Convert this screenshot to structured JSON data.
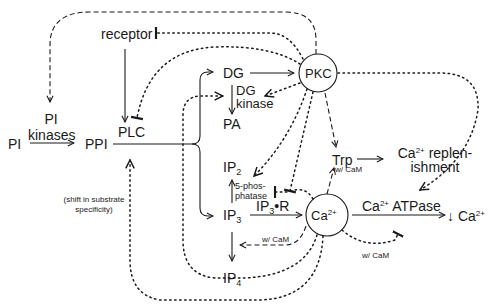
{
  "diagram": {
    "type": "signaling-pathway",
    "colors": {
      "ink": "#1a1a1a",
      "background": "#ffffff"
    },
    "nodes": {
      "receptor": "receptor",
      "pi": "PI",
      "pi_kinases_line1": "PI",
      "pi_kinases_line2": "kinases",
      "ppi": "PPI",
      "plc": "PLC",
      "dg": "DG",
      "dg_kinase_line1": "DG",
      "dg_kinase_line2": "kinase",
      "pa": "PA",
      "pkc": "PKC",
      "trp": "Trp",
      "ca_replenishment_line1_base": "Ca",
      "ca_replenishment_line1_sup": "2+",
      "ca_replenishment_line1_rest": " replen-",
      "ca_replenishment_line2": "ishment",
      "ip2_base": "IP",
      "ip2_sub": "2",
      "five_phosphatase_line1": "5-phos-",
      "five_phosphatase_line2": "phatase",
      "ip3_base": "IP",
      "ip3_sub": "3",
      "ip3r_base": "IP",
      "ip3r_sub": "3",
      "ip3r_rest": "•R",
      "ca_base": "Ca",
      "ca_sup": "2+",
      "ca_atpase_base": "Ca",
      "ca_atpase_sup": "2+",
      "ca_atpase_rest": " ATPase",
      "ca_decrease_prefix": "↓ Ca",
      "ca_decrease_sup": "2+",
      "ip4_base": "IP",
      "ip4_sub": "4"
    },
    "annotations": {
      "shift_line1": "(shift in substrate",
      "shift_line2": "specificity)",
      "w_cam_trp": "w/ CaM",
      "w_cam_ip4": "w/ CaM",
      "w_cam_atpase": "w/ CaM"
    },
    "edges": [
      {
        "from": "PI",
        "to": "PPI",
        "style": "solid",
        "label": "PI kinases"
      },
      {
        "from": "receptor",
        "to": "PLC",
        "style": "solid"
      },
      {
        "from": "PPI",
        "to": "DG",
        "style": "solid",
        "via": "PLC"
      },
      {
        "from": "PPI",
        "to": "IP3",
        "style": "solid",
        "via": "PLC"
      },
      {
        "from": "DG",
        "to": "PKC",
        "style": "solid"
      },
      {
        "from": "DG",
        "to": "PA",
        "style": "solid",
        "label": "DG kinase"
      },
      {
        "from": "IP3",
        "to": "IP2",
        "style": "solid",
        "label": "5-phosphatase"
      },
      {
        "from": "IP3",
        "to": "Ca2+",
        "style": "solid",
        "label": "IP3•R"
      },
      {
        "from": "IP3",
        "to": "IP4",
        "style": "solid"
      },
      {
        "from": "Trp",
        "to": "Ca2+ replenishment",
        "style": "solid"
      },
      {
        "from": "Ca2+",
        "to": "↓ Ca2+",
        "style": "solid",
        "label": "Ca2+ ATPase"
      },
      {
        "from": "PKC",
        "to": "PI kinases",
        "style": "dashed"
      },
      {
        "from": "PKC",
        "to": "receptor",
        "style": "dashed",
        "effect": "inhibit"
      },
      {
        "from": "PKC",
        "to": "PLC",
        "style": "dotted",
        "effect": "inhibit"
      },
      {
        "from": "PKC",
        "to": "DG kinase",
        "style": "dotted"
      },
      {
        "from": "PKC",
        "to": "5-phosphatase",
        "style": "dotted"
      },
      {
        "from": "PKC",
        "to": "Trp",
        "style": "dashed"
      },
      {
        "from": "PKC",
        "to": "Ca2+ ATPase",
        "style": "dotted"
      },
      {
        "from": "Ca2+",
        "to": "Trp",
        "style": "dashed",
        "label": "w/ CaM"
      },
      {
        "from": "Ca2+",
        "to": "5-phosphatase",
        "style": "dotted",
        "effect": "inhibit"
      },
      {
        "from": "Ca2+",
        "to": "IP3 kinase",
        "style": "dashed",
        "label": "w/ CaM"
      },
      {
        "from": "Ca2+",
        "to": "Ca2+ ATPase",
        "style": "dotted",
        "label": "w/ CaM"
      },
      {
        "from": "Ca2+",
        "to": "DG kinase",
        "style": "dotted"
      },
      {
        "from": "Ca2+",
        "to": "PLC",
        "style": "dotted",
        "label": "(shift in substrate specificity)"
      }
    ]
  }
}
